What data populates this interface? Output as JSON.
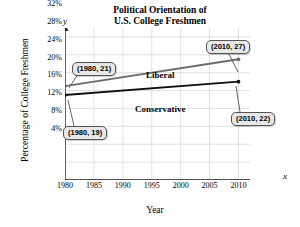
{
  "chart_data": {
    "type": "line",
    "title": "Political Orientation of U.S. College Freshmen",
    "title_line1": "Political Orientation of",
    "title_line2": "U.S. College Freshmen",
    "xlabel": "Year",
    "ylabel": "Percentage of College Freshmen",
    "x_axis_letter": "x",
    "y_axis_letter": "y",
    "grid": true,
    "legend_position": "inline",
    "xlim": [
      1980,
      2012
    ],
    "ylim": [
      0,
      34
    ],
    "x": [
      1980,
      2010
    ],
    "xticks": [
      1980,
      1985,
      1990,
      1995,
      2000,
      2005,
      2010
    ],
    "xticklabels": [
      "1980",
      "1985",
      "1990",
      "1995",
      "2000",
      "2005",
      "2010"
    ],
    "yticks": [
      4,
      8,
      12,
      16,
      20,
      24,
      28,
      32
    ],
    "yticklabels": [
      "4%",
      "8%",
      "12%",
      "16%",
      "20%",
      "24%",
      "28%",
      "32%"
    ],
    "series": [
      {
        "name": "Liberal",
        "values": [
          21,
          27
        ],
        "color": "#6b6b6b"
      },
      {
        "name": "Conservative",
        "values": [
          19,
          22
        ],
        "color": "#101010"
      }
    ],
    "annotations": [
      {
        "text": "(1980, 21)",
        "series": "Liberal",
        "point": [
          1980,
          21
        ]
      },
      {
        "text": "(2010, 27)",
        "series": "Liberal",
        "point": [
          2010,
          27
        ]
      },
      {
        "text": "(1980, 19)",
        "series": "Conservative",
        "point": [
          1980,
          19
        ]
      },
      {
        "text": "(2010, 22)",
        "series": "Conservative",
        "point": [
          2010,
          22
        ]
      }
    ]
  },
  "colors": {
    "grid": "#d8d8d8",
    "axis": "#1a1a1a",
    "liberal": "#6b6b6b",
    "conservative": "#101010",
    "callout_bg": "#e8e8e8",
    "callout_border": "#555555"
  }
}
